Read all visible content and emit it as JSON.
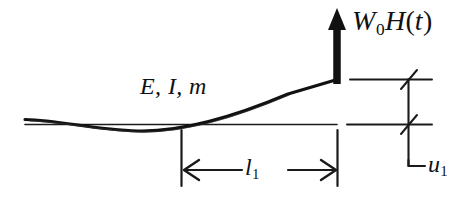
{
  "figure": {
    "type": "engineering-diagram",
    "background_color": "#ffffff",
    "ink_color": "#111111"
  },
  "labels": {
    "load": {
      "name": "load-label",
      "text": "W0H(t)",
      "parts": {
        "symbol": "W",
        "subscript": "0",
        "function": "H",
        "open_paren": "(",
        "argument": "t",
        "close_paren": ")"
      }
    },
    "beam_properties": {
      "name": "beam-properties-label",
      "text": "E, I, m",
      "parts": {
        "youngs_modulus": "E,",
        "second_moment": "I,",
        "mass_per_length": "m"
      }
    },
    "length": {
      "name": "length-dimension-label",
      "text": "l1",
      "parts": {
        "symbol": "l",
        "subscript": "1"
      }
    },
    "displacement": {
      "name": "displacement-dimension-label",
      "text": "u1",
      "parts": {
        "symbol": "u",
        "subscript": "1"
      }
    }
  },
  "geometry": {
    "reference_line": {
      "x1": 25,
      "y1": 124,
      "x2": 337,
      "y2": 124
    },
    "beam_curve": "M 25 120 C 70 121, 95 130, 140 131 C 190 132, 245 112, 290 93 L 336 80",
    "load_arrow": {
      "x": 337,
      "y_base": 82,
      "y_tip": 10
    },
    "length_dimension": {
      "extension_left_x": 181,
      "extension_right_x": 337,
      "extension_top_y": 130,
      "extension_bottom_y": 186,
      "arrow_line_y": 170,
      "arrow_left_x": 186,
      "arrow_right_x": 333
    },
    "displacement_dimension": {
      "top_line_y": 79,
      "bottom_line_y": 124,
      "line_x1": 350,
      "line_x2": 432,
      "vertical_x": 408,
      "leader_bottom_y": 166,
      "leader_right_x": 424
    }
  }
}
